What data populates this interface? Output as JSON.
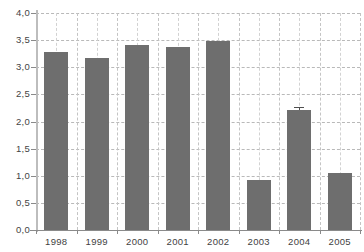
{
  "chart_data": {
    "type": "bar",
    "title": "",
    "subtitle": "",
    "xlabel": "",
    "ylabel": "",
    "categories": [
      "1998",
      "1999",
      "2000",
      "2001",
      "2002",
      "2003",
      "2004",
      "2005"
    ],
    "values": [
      3.28,
      3.17,
      3.41,
      3.37,
      3.49,
      0.92,
      2.21,
      1.05
    ],
    "series": [
      {
        "name": "",
        "values": [
          3.28,
          3.17,
          3.41,
          3.37,
          3.49,
          0.92,
          2.21,
          1.05
        ],
        "color": "#6e6e6e"
      }
    ],
    "error_bars": [
      null,
      null,
      null,
      null,
      null,
      null,
      0.05,
      null
    ],
    "ylim": [
      0.0,
      4.0
    ],
    "ytick_values": [
      0.0,
      0.5,
      1.0,
      1.5,
      2.0,
      2.5,
      3.0,
      3.5,
      4.0
    ],
    "ytick_labels": [
      "0,0",
      "0,5",
      "1,0",
      "1,5",
      "2,0",
      "2,5",
      "3,0",
      "3,5",
      "4,0"
    ],
    "xtick_labels": [
      "1998",
      "1999",
      "2000",
      "2001",
      "2002",
      "2003",
      "2004",
      "2005"
    ],
    "grid": "both",
    "grid_style": "dashed",
    "legend": "none",
    "annotations": [],
    "decimal_separator": ","
  },
  "colors": {
    "bar": "#6e6e6e",
    "grid": "#bdbdbd",
    "axis": "#8a8a8a",
    "text": "#3f3f3f",
    "background": "#ffffff"
  }
}
